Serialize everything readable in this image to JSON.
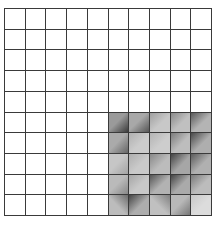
{
  "grid": {
    "rows": 10,
    "cols": 10,
    "line_color": "#3a3a3a",
    "background": "#ffffff",
    "shaded_region": {
      "row_start": 5,
      "row_end": 9,
      "col_start": 5,
      "col_end": 9
    },
    "shaded_cells": [
      [
        {
          "base": "#9a9a9a",
          "dark": "#3c3c3c",
          "dir": "to top left"
        },
        {
          "base": "#a8a8a8",
          "dark": "#555555",
          "dir": "to top left"
        },
        {
          "base": "#c8c8c8",
          "dark": "#a0a0a0",
          "dir": "to bottom right"
        },
        {
          "base": "#c0c0c0",
          "dark": "#8a8a8a",
          "dir": "to bottom right"
        },
        {
          "base": "#b4b4b4",
          "dark": "#5a5a5a",
          "dir": "to bottom right"
        }
      ],
      [
        {
          "base": "#aaaaaa",
          "dark": "#666666",
          "dir": "to top left"
        },
        {
          "base": "#cccccc",
          "dark": "#b0b0b0",
          "dir": "to bottom right"
        },
        {
          "base": "#cdcdcd",
          "dark": "#b4b4b4",
          "dir": "to bottom right"
        },
        {
          "base": "#bdbdbd",
          "dark": "#7c7c7c",
          "dir": "to bottom right"
        },
        {
          "base": "#aeaeae",
          "dark": "#4a4a4a",
          "dir": "to bottom right"
        }
      ],
      [
        {
          "base": "#c6c6c6",
          "dark": "#a4a4a4",
          "dir": "to top left"
        },
        {
          "base": "#cacaca",
          "dark": "#aeaeae",
          "dir": "to bottom right"
        },
        {
          "base": "#bcbcbc",
          "dark": "#888888",
          "dir": "to bottom right"
        },
        {
          "base": "#a6a6a6",
          "dark": "#444444",
          "dir": "to bottom right"
        },
        {
          "base": "#b0b0b0",
          "dark": "#5c5c5c",
          "dir": "to bottom right"
        }
      ],
      [
        {
          "base": "#bababa",
          "dark": "#888888",
          "dir": "to top left"
        },
        {
          "base": "#c8c8c8",
          "dark": "#a6a6a6",
          "dir": "to bottom right"
        },
        {
          "base": "#b2b2b2",
          "dark": "#555555",
          "dir": "to bottom right"
        },
        {
          "base": "#aaaaaa",
          "dark": "#454545",
          "dir": "to bottom right"
        },
        {
          "base": "#bcbcbc",
          "dark": "#7a7a7a",
          "dir": "to bottom right"
        }
      ],
      [
        {
          "base": "#bcbcbc",
          "dark": "#6c6c6c",
          "dir": "to bottom left"
        },
        {
          "base": "#adadad",
          "dark": "#444444",
          "dir": "to bottom right"
        },
        {
          "base": "#c0c0c0",
          "dark": "#808080",
          "dir": "to bottom left"
        },
        {
          "base": "#b8b8b8",
          "dark": "#777777",
          "dir": "to top left"
        },
        {
          "base": "#dcdcdc",
          "dark": "#c8c8c8",
          "dir": "to bottom right"
        }
      ]
    ]
  }
}
